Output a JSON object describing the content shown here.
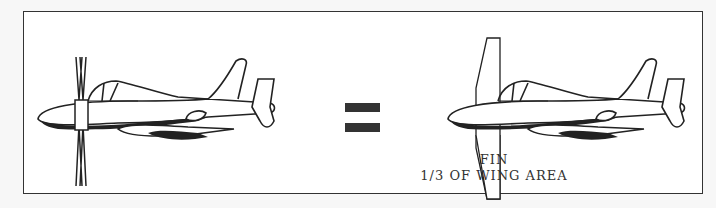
{
  "diagram": {
    "left_figure": {
      "label": "aircraft-with-cruciform-fins"
    },
    "operator": {
      "symbol": "="
    },
    "right_figure": {
      "label": "aircraft-with-single-fin"
    },
    "caption": {
      "line1": "FIN",
      "line2": "1/3 OF WING AREA"
    },
    "colors": {
      "ink": "#222222",
      "paper": "#ffffff",
      "border": "#333333"
    }
  }
}
